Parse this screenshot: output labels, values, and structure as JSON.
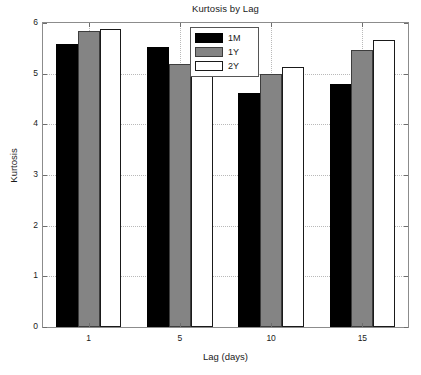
{
  "chart_data": {
    "type": "bar",
    "title": "Kurtosis by Lag",
    "xlabel": "Lag (days)",
    "ylabel": "Kurtosis",
    "categories": [
      "1",
      "5",
      "10",
      "15"
    ],
    "series": [
      {
        "name": "1M",
        "color": "#000000",
        "values": [
          5.58,
          5.53,
          4.61,
          4.79
        ]
      },
      {
        "name": "1Y",
        "color": "#848484",
        "values": [
          5.85,
          5.19,
          4.99,
          5.47
        ]
      },
      {
        "name": "2Y",
        "color": "#ffffff",
        "values": [
          5.89,
          5.34,
          5.14,
          5.66
        ]
      }
    ],
    "ylim": [
      0,
      6
    ],
    "yticks": [
      "0",
      "1",
      "2",
      "3",
      "4",
      "5",
      "6"
    ],
    "xticks": [
      "1",
      "5",
      "10",
      "15"
    ],
    "grid": true,
    "grid_style": "dotted",
    "legend_position": "top-center",
    "background": "#ffffff",
    "axis_color": "#8c8c8c"
  }
}
